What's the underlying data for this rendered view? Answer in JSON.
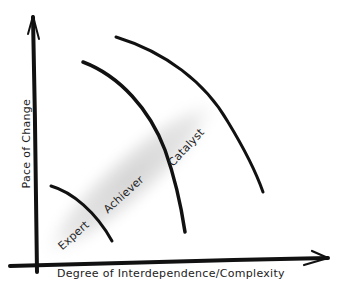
{
  "diagram": {
    "x_axis_label": "Degree of Interdependence/Complexity",
    "y_axis_label": "Pace of Change",
    "zones": [
      {
        "label": "Expert"
      },
      {
        "label": "Achiever"
      },
      {
        "label": "Catalyst"
      }
    ],
    "colors": {
      "ink": "#111111",
      "band": "#d6d6d6",
      "background": "#ffffff"
    }
  }
}
